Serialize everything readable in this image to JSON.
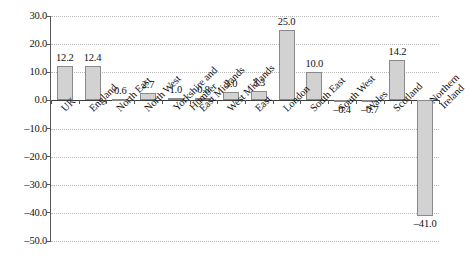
{
  "chart_data": {
    "type": "bar",
    "title": "",
    "subtitle": "",
    "xlabel": "",
    "ylabel": "",
    "ylim": [
      -50.0,
      30.0
    ],
    "ytick_step": 10.0,
    "grid": true,
    "legend": false,
    "legend_position": "none",
    "bar_color": "#d2d2d2",
    "bar_border_color": "#8a8a8a",
    "gridline_color": "#b9b9b9",
    "axis_color": "#565656",
    "ytick_labels": [
      "30.0",
      "20.0",
      "10.0",
      "0.0",
      "–10.0",
      "–20.0",
      "–30.0",
      "–40.0",
      "–50.0"
    ],
    "ytick_values": [
      30,
      20,
      10,
      0,
      -10,
      -20,
      -30,
      -40,
      -50
    ],
    "categories": [
      "UK",
      "England",
      "North East",
      "North West",
      "Yorkshire and Humber",
      "East Midlands",
      "West Midlands",
      "East",
      "London",
      "South East",
      "South West",
      "Wales",
      "Scotland",
      "Northern Ireland"
    ],
    "values": [
      12.2,
      12.4,
      0.6,
      2.7,
      1.0,
      0.8,
      3.0,
      3.3,
      25.0,
      10.0,
      -0.4,
      -0.7,
      14.2,
      -41.0
    ],
    "value_labels": [
      "12.2",
      "12.4",
      "0.6",
      "2.7",
      "1.0",
      "0.8",
      "3.0",
      "3.3",
      "25.0",
      "10.0",
      "–0.4",
      "–0.7",
      "14.2",
      "–41.0"
    ]
  }
}
